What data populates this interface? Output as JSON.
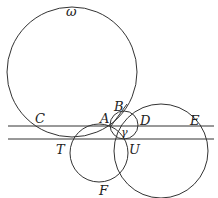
{
  "diagram": {
    "stroke_color": "#333333",
    "labels": {
      "omega": "ω",
      "gamma": "γ",
      "A": "A",
      "B": "B",
      "C": "C",
      "D": "D",
      "E": "E",
      "T": "T",
      "U": "U",
      "F": "F"
    },
    "circles": [
      {
        "name": "omega",
        "cx": 72,
        "cy": 72,
        "r": 65
      },
      {
        "name": "gamma",
        "cx": 124,
        "cy": 125,
        "r": 14
      },
      {
        "name": "circle-ATF",
        "cx": 99,
        "cy": 153,
        "r": 29
      },
      {
        "name": "circle-BEU",
        "cx": 161,
        "cy": 151,
        "r": 47
      }
    ],
    "lines": [
      {
        "name": "line-CADE",
        "y": 126
      },
      {
        "name": "line-TU",
        "y": 139
      }
    ]
  }
}
